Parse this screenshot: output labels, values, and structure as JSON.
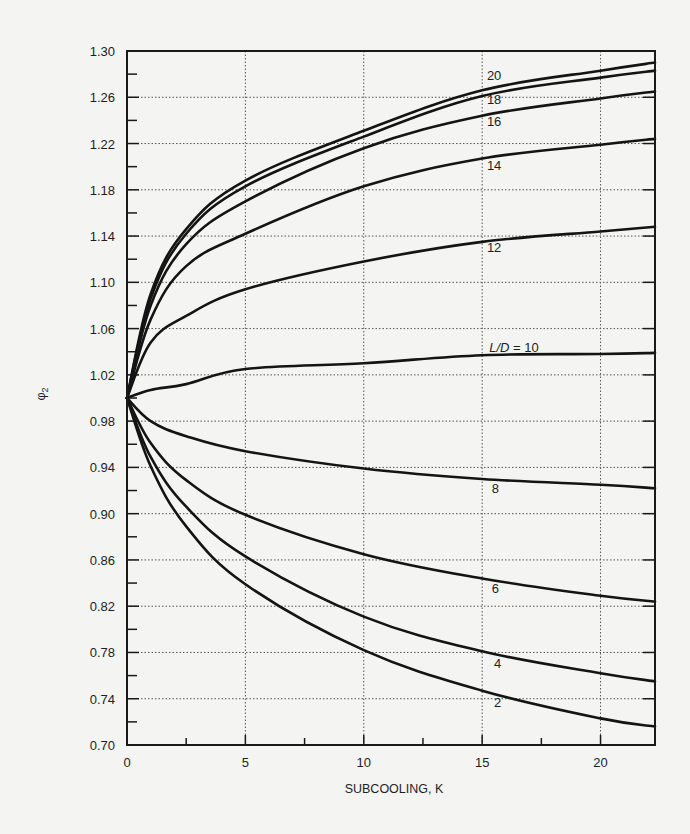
{
  "chart_data": {
    "type": "line",
    "title": "",
    "xlabel": "SUBCOOLING, K",
    "ylabel": "φ2",
    "xlim": [
      0,
      22.3
    ],
    "ylim": [
      0.7,
      1.3
    ],
    "x_ticks": [
      0,
      5,
      10,
      15,
      20
    ],
    "x_tick_labels": [
      "0",
      "5",
      "10",
      "15",
      "20"
    ],
    "x_minor_ticks": [
      2.5,
      7.5,
      12.5,
      17.5
    ],
    "y_ticks": [
      0.7,
      0.74,
      0.78,
      0.82,
      0.86,
      0.9,
      0.94,
      0.98,
      1.02,
      1.06,
      1.1,
      1.14,
      1.18,
      1.22,
      1.26,
      1.3
    ],
    "y_tick_labels": [
      "0.70",
      "0.74",
      "0.78",
      "0.82",
      "0.86",
      "0.90",
      "0.94",
      "0.98",
      "1.02",
      "1.06",
      "1.10",
      "1.14",
      "1.18",
      "1.22",
      "1.26",
      "1.30"
    ],
    "y_minor_ticks": [
      0.72,
      0.76,
      0.8,
      0.84,
      0.88,
      0.92,
      0.96,
      1.0,
      1.04,
      1.08,
      1.12,
      1.16,
      1.2,
      1.24,
      1.28
    ],
    "grid": {
      "x": [
        5,
        10,
        15,
        20
      ],
      "y": [
        0.74,
        0.78,
        0.82,
        0.86,
        0.9,
        0.94,
        0.98,
        1.02,
        1.06,
        1.1,
        1.14,
        1.18,
        1.22,
        1.26
      ],
      "style": "dotted"
    },
    "legend": "inline curve labels (L/D parameter)",
    "x": [
      0,
      1,
      2.5,
      5,
      10,
      15,
      20,
      22.3
    ],
    "series": [
      {
        "name": "20",
        "label": "20",
        "values": [
          1.0,
          1.09,
          1.146,
          1.188,
          1.231,
          1.266,
          1.283,
          1.29
        ],
        "label_pos": [
          15.2,
          1.275
        ]
      },
      {
        "name": "18",
        "label": "18",
        "values": [
          1.0,
          1.086,
          1.142,
          1.183,
          1.226,
          1.261,
          1.277,
          1.283
        ],
        "label_pos": [
          15.2,
          1.254
        ]
      },
      {
        "name": "16",
        "label": "16",
        "values": [
          1.0,
          1.08,
          1.133,
          1.17,
          1.216,
          1.244,
          1.259,
          1.265
        ],
        "label_pos": [
          15.2,
          1.235
        ]
      },
      {
        "name": "14",
        "label": "14",
        "values": [
          1.0,
          1.068,
          1.114,
          1.142,
          1.183,
          1.207,
          1.219,
          1.224
        ],
        "label_pos": [
          15.2,
          1.197
        ]
      },
      {
        "name": "12",
        "label": "12",
        "values": [
          1.0,
          1.048,
          1.071,
          1.094,
          1.118,
          1.135,
          1.144,
          1.148
        ],
        "label_pos": [
          15.2,
          1.126
        ]
      },
      {
        "name": "10",
        "label": "L/D = 10",
        "values": [
          1.0,
          1.007,
          1.012,
          1.025,
          1.03,
          1.037,
          1.038,
          1.039
        ],
        "label_pos": [
          15.3,
          1.04
        ]
      },
      {
        "name": "8",
        "label": "8",
        "values": [
          1.0,
          0.98,
          0.967,
          0.954,
          0.939,
          0.93,
          0.925,
          0.922
        ],
        "label_pos": [
          15.4,
          0.918
        ]
      },
      {
        "name": "6",
        "label": "6",
        "values": [
          1.0,
          0.961,
          0.929,
          0.899,
          0.865,
          0.844,
          0.829,
          0.824
        ],
        "label_pos": [
          15.4,
          0.831
        ]
      },
      {
        "name": "4",
        "label": "4",
        "values": [
          1.0,
          0.949,
          0.906,
          0.863,
          0.811,
          0.781,
          0.762,
          0.755
        ],
        "label_pos": [
          15.5,
          0.767
        ]
      },
      {
        "name": "2",
        "label": "2",
        "values": [
          1.0,
          0.941,
          0.889,
          0.839,
          0.782,
          0.747,
          0.723,
          0.716
        ],
        "label_pos": [
          15.5,
          0.733
        ]
      }
    ],
    "colors": {
      "curve": "#141414",
      "axis": "#1a1a1a",
      "grid": "#555555",
      "background": "#f4f4f2"
    }
  }
}
